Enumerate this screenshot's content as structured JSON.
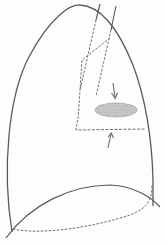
{
  "diagram": {
    "subject": "lung outline with lesion",
    "colors": {
      "outline": "#5a5a5a",
      "dashed": "#6e6e6e",
      "lesion_fill": "#bdbdbd",
      "lesion_stipple": "#8a8a8a",
      "arrow": "#6a6a6a",
      "background": "#fdfdfd"
    },
    "elements": {
      "lung_outline": "solid apex-shaped lung contour",
      "diaphragm_curve": "solid diaphragm dome line",
      "posterior_base": "dashed posterior costophrenic border",
      "fissure_lines": "dashed fissure / mediastinal lines",
      "airway_lines": "solid tracheal/bronchial lines",
      "lesion": "stippled oval opacity",
      "arrow_top": "downward arrow pointing to lesion",
      "arrow_bottom": "upward arrow pointing to dashed border"
    }
  }
}
